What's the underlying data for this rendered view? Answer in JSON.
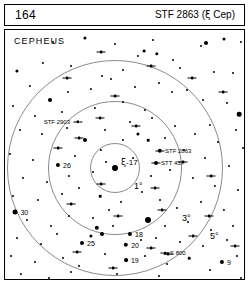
{
  "header": {
    "page_number": "164",
    "title_prefix": "STF 2863 (",
    "title_greek": "ξ",
    "title_suffix": " Cep)"
  },
  "chart_data": {
    "type": "scatter",
    "title": "STF 2863 (ξ Cep)",
    "subtitle": "CEPHEUS",
    "constellation": "CEPHEUS",
    "xlabel": "",
    "ylabel": "",
    "grid": false,
    "legend_position": "none",
    "projection": "finder chart, north up",
    "center_object": "ξ-17",
    "radius_circles": [
      {
        "label": "1°",
        "radius_deg": 1,
        "px_radius": 25,
        "label_x": 126,
        "label_y": 156
      },
      {
        "label": "3°",
        "radius_deg": 3,
        "px_radius": 67,
        "label_x": 174,
        "label_y": 188
      },
      {
        "label": "5°",
        "radius_deg": 5,
        "px_radius": 108,
        "label_x": 202,
        "label_y": 206
      }
    ],
    "center_px": {
      "x": 110,
      "y": 138
    },
    "named_objects": [
      {
        "name": "STF 2903",
        "type": "double",
        "x": 73,
        "y": 92,
        "label_side": "left",
        "mag_px": 3.4
      },
      {
        "name": "STF 2863",
        "type": "double",
        "x": 155,
        "y": 121,
        "label_side": "right",
        "mag_px": 4.4
      },
      {
        "name": "STT 457",
        "type": "double",
        "x": 151,
        "y": 133,
        "label_side": "right",
        "mag_px": 4.0
      },
      {
        "name": "S 800",
        "type": "double",
        "x": 160,
        "y": 223,
        "label_side": "right",
        "mag_px": 2.6
      },
      {
        "name": "ξ-17",
        "type": "center",
        "x": 110,
        "y": 158,
        "label_side": "right",
        "mag_px": 6.0
      }
    ],
    "labeled_stars": [
      {
        "label": "7",
        "x": 234,
        "y": 84,
        "mag_px": 4.6,
        "label_side": "right"
      },
      {
        "label": "26",
        "x": 53,
        "y": 135,
        "mag_px": 4.2,
        "label_side": "right"
      },
      {
        "label": "30",
        "x": 10,
        "y": 182,
        "mag_px": 4.8,
        "label_side": "right"
      },
      {
        "label": "25",
        "x": 77,
        "y": 213,
        "mag_px": 4.0,
        "label_side": "right"
      },
      {
        "label": "18",
        "x": 125,
        "y": 204,
        "mag_px": 4.2,
        "label_side": "right"
      },
      {
        "label": "20",
        "x": 121,
        "y": 215,
        "mag_px": 4.4,
        "label_side": "right"
      },
      {
        "label": "19",
        "x": 121,
        "y": 230,
        "mag_px": 3.8,
        "label_side": "right"
      },
      {
        "label": "9",
        "x": 217,
        "y": 232,
        "mag_px": 4.2,
        "label_side": "right"
      },
      {
        "label": "V-10",
        "x": 195,
        "y": 261,
        "mag_px": 5.0,
        "label_side": "right"
      },
      {
        "label": "12",
        "x": 186,
        "y": 278,
        "mag_px": 3.2,
        "label_side": "right"
      }
    ],
    "field_stars": [
      {
        "x": 80,
        "y": 8,
        "r": 1.6
      },
      {
        "x": 110,
        "y": 14,
        "r": 1.0
      },
      {
        "x": 148,
        "y": 10,
        "r": 1.1
      },
      {
        "x": 152,
        "y": 24,
        "r": 1.7
      },
      {
        "x": 196,
        "y": 16,
        "r": 1.0
      },
      {
        "x": 201,
        "y": 13,
        "r": 2.0
      },
      {
        "x": 219,
        "y": 9,
        "r": 1.5
      },
      {
        "x": 236,
        "y": 12,
        "r": 1.1
      },
      {
        "x": 48,
        "y": 12,
        "r": 1.0
      },
      {
        "x": 133,
        "y": 26,
        "r": 1.1
      },
      {
        "x": 139,
        "y": 21,
        "r": 1.4
      },
      {
        "x": 168,
        "y": 30,
        "r": 1.0
      },
      {
        "x": 175,
        "y": 38,
        "r": 1.0
      },
      {
        "x": 12,
        "y": 41,
        "r": 1.6
      },
      {
        "x": 38,
        "y": 33,
        "r": 1.1
      },
      {
        "x": 66,
        "y": 36,
        "r": 1.0
      },
      {
        "x": 97,
        "y": 46,
        "r": 1.0
      },
      {
        "x": 118,
        "y": 40,
        "r": 1.0
      },
      {
        "x": 209,
        "y": 42,
        "r": 1.1
      },
      {
        "x": 228,
        "y": 43,
        "r": 1.0
      },
      {
        "x": 243,
        "y": 50,
        "r": 1.0
      },
      {
        "x": 25,
        "y": 56,
        "r": 1.1
      },
      {
        "x": 45,
        "y": 70,
        "r": 2.0
      },
      {
        "x": 63,
        "y": 62,
        "r": 1.1
      },
      {
        "x": 86,
        "y": 59,
        "r": 1.1
      },
      {
        "x": 106,
        "y": 49,
        "r": 1.0
      },
      {
        "x": 130,
        "y": 57,
        "r": 1.0
      },
      {
        "x": 154,
        "y": 53,
        "r": 1.0
      },
      {
        "x": 182,
        "y": 60,
        "r": 1.0
      },
      {
        "x": 198,
        "y": 70,
        "r": 1.0
      },
      {
        "x": 222,
        "y": 73,
        "r": 1.0
      },
      {
        "x": 244,
        "y": 82,
        "r": 1.4
      },
      {
        "x": 8,
        "y": 76,
        "r": 1.0
      },
      {
        "x": 30,
        "y": 86,
        "r": 1.0
      },
      {
        "x": 57,
        "y": 82,
        "r": 1.0
      },
      {
        "x": 90,
        "y": 78,
        "r": 1.1
      },
      {
        "x": 118,
        "y": 72,
        "r": 1.0
      },
      {
        "x": 140,
        "y": 80,
        "r": 1.0
      },
      {
        "x": 167,
        "y": 62,
        "r": 1.0
      },
      {
        "x": 205,
        "y": 95,
        "r": 1.1
      },
      {
        "x": 231,
        "y": 100,
        "r": 1.0
      },
      {
        "x": 15,
        "y": 100,
        "r": 1.0
      },
      {
        "x": 37,
        "y": 104,
        "r": 1.1
      },
      {
        "x": 62,
        "y": 98,
        "r": 1.0
      },
      {
        "x": 80,
        "y": 110,
        "r": 2.0
      },
      {
        "x": 100,
        "y": 100,
        "r": 1.0
      },
      {
        "x": 125,
        "y": 92,
        "r": 1.0
      },
      {
        "x": 147,
        "y": 88,
        "r": 1.0
      },
      {
        "x": 170,
        "y": 96,
        "r": 1.0
      },
      {
        "x": 190,
        "y": 104,
        "r": 1.0
      },
      {
        "x": 213,
        "y": 112,
        "r": 1.0
      },
      {
        "x": 238,
        "y": 118,
        "r": 1.0
      },
      {
        "x": 5,
        "y": 124,
        "r": 1.0
      },
      {
        "x": 28,
        "y": 130,
        "r": 1.0
      },
      {
        "x": 70,
        "y": 126,
        "r": 1.0
      },
      {
        "x": 96,
        "y": 120,
        "r": 1.1
      },
      {
        "x": 118,
        "y": 110,
        "r": 1.1
      },
      {
        "x": 133,
        "y": 104,
        "r": 1.6
      },
      {
        "x": 143,
        "y": 110,
        "r": 1.3
      },
      {
        "x": 160,
        "y": 108,
        "r": 1.0
      },
      {
        "x": 179,
        "y": 120,
        "r": 1.0
      },
      {
        "x": 200,
        "y": 128,
        "r": 1.0
      },
      {
        "x": 224,
        "y": 136,
        "r": 1.0
      },
      {
        "x": 244,
        "y": 140,
        "r": 1.0
      },
      {
        "x": 18,
        "y": 148,
        "r": 1.0
      },
      {
        "x": 42,
        "y": 152,
        "r": 1.0
      },
      {
        "x": 64,
        "y": 146,
        "r": 1.1
      },
      {
        "x": 88,
        "y": 142,
        "r": 1.0
      },
      {
        "x": 101,
        "y": 132,
        "r": 1.0
      },
      {
        "x": 128,
        "y": 128,
        "r": 1.0
      },
      {
        "x": 146,
        "y": 146,
        "r": 1.0
      },
      {
        "x": 165,
        "y": 140,
        "r": 1.0
      },
      {
        "x": 188,
        "y": 148,
        "r": 1.1
      },
      {
        "x": 210,
        "y": 156,
        "r": 1.1
      },
      {
        "x": 233,
        "y": 160,
        "r": 1.0
      },
      {
        "x": 8,
        "y": 166,
        "r": 1.0
      },
      {
        "x": 33,
        "y": 170,
        "r": 1.0
      },
      {
        "x": 57,
        "y": 164,
        "r": 1.0
      },
      {
        "x": 74,
        "y": 158,
        "r": 1.0
      },
      {
        "x": 95,
        "y": 166,
        "r": 1.3
      },
      {
        "x": 116,
        "y": 172,
        "r": 1.0
      },
      {
        "x": 137,
        "y": 162,
        "r": 1.0
      },
      {
        "x": 155,
        "y": 170,
        "r": 1.0
      },
      {
        "x": 172,
        "y": 178,
        "r": 1.0
      },
      {
        "x": 196,
        "y": 172,
        "r": 1.0
      },
      {
        "x": 219,
        "y": 180,
        "r": 1.1
      },
      {
        "x": 241,
        "y": 176,
        "r": 1.0
      },
      {
        "x": 22,
        "y": 190,
        "r": 1.0
      },
      {
        "x": 46,
        "y": 196,
        "r": 1.0
      },
      {
        "x": 64,
        "y": 186,
        "r": 1.1
      },
      {
        "x": 88,
        "y": 188,
        "r": 1.0
      },
      {
        "x": 104,
        "y": 180,
        "r": 1.0
      },
      {
        "x": 143,
        "y": 190,
        "r": 3.0
      },
      {
        "x": 160,
        "y": 196,
        "r": 1.0
      },
      {
        "x": 183,
        "y": 192,
        "r": 1.0
      },
      {
        "x": 206,
        "y": 200,
        "r": 1.0
      },
      {
        "x": 228,
        "y": 196,
        "r": 1.0
      },
      {
        "x": 12,
        "y": 208,
        "r": 1.0
      },
      {
        "x": 36,
        "y": 214,
        "r": 1.0
      },
      {
        "x": 52,
        "y": 204,
        "r": 1.0
      },
      {
        "x": 92,
        "y": 198,
        "r": 2.2
      },
      {
        "x": 97,
        "y": 204,
        "r": 2.0
      },
      {
        "x": 86,
        "y": 206,
        "r": 1.6
      },
      {
        "x": 108,
        "y": 196,
        "r": 1.0
      },
      {
        "x": 136,
        "y": 210,
        "r": 1.0
      },
      {
        "x": 151,
        "y": 208,
        "r": 1.0
      },
      {
        "x": 175,
        "y": 212,
        "r": 1.0
      },
      {
        "x": 198,
        "y": 216,
        "r": 1.0
      },
      {
        "x": 222,
        "y": 210,
        "r": 1.0
      },
      {
        "x": 242,
        "y": 206,
        "r": 1.0
      },
      {
        "x": 6,
        "y": 226,
        "r": 1.0
      },
      {
        "x": 30,
        "y": 232,
        "r": 1.0
      },
      {
        "x": 58,
        "y": 228,
        "r": 1.0
      },
      {
        "x": 74,
        "y": 236,
        "r": 1.0
      },
      {
        "x": 100,
        "y": 224,
        "r": 1.0
      },
      {
        "x": 140,
        "y": 226,
        "r": 1.1
      },
      {
        "x": 162,
        "y": 234,
        "r": 1.0
      },
      {
        "x": 184,
        "y": 228,
        "r": 1.3
      },
      {
        "x": 205,
        "y": 240,
        "r": 1.0
      },
      {
        "x": 232,
        "y": 226,
        "r": 1.0
      },
      {
        "x": 16,
        "y": 244,
        "r": 1.1
      },
      {
        "x": 44,
        "y": 248,
        "r": 1.0
      },
      {
        "x": 66,
        "y": 242,
        "r": 1.0
      },
      {
        "x": 88,
        "y": 250,
        "r": 1.0
      },
      {
        "x": 112,
        "y": 244,
        "r": 1.0
      },
      {
        "x": 130,
        "y": 252,
        "r": 1.0
      },
      {
        "x": 154,
        "y": 246,
        "r": 1.0
      },
      {
        "x": 172,
        "y": 254,
        "r": 1.6
      },
      {
        "x": 210,
        "y": 252,
        "r": 1.0
      },
      {
        "x": 236,
        "y": 248,
        "r": 1.0
      },
      {
        "x": 52,
        "y": 262,
        "r": 1.0
      },
      {
        "x": 78,
        "y": 268,
        "r": 1.0
      },
      {
        "x": 104,
        "y": 262,
        "r": 1.0
      },
      {
        "x": 122,
        "y": 270,
        "r": 2.6
      },
      {
        "x": 140,
        "y": 264,
        "r": 1.0
      },
      {
        "x": 160,
        "y": 272,
        "r": 1.0
      },
      {
        "x": 228,
        "y": 266,
        "r": 1.0
      },
      {
        "x": 24,
        "y": 272,
        "r": 1.0
      }
    ],
    "doubles": [
      {
        "x": 96,
        "y": 22
      },
      {
        "x": 146,
        "y": 36
      },
      {
        "x": 62,
        "y": 48
      },
      {
        "x": 110,
        "y": 66
      },
      {
        "x": 187,
        "y": 48
      },
      {
        "x": 53,
        "y": 118
      },
      {
        "x": 74,
        "y": 108
      },
      {
        "x": 131,
        "y": 96
      },
      {
        "x": 178,
        "y": 132
      },
      {
        "x": 206,
        "y": 146
      },
      {
        "x": 150,
        "y": 158
      },
      {
        "x": 96,
        "y": 154
      },
      {
        "x": 66,
        "y": 174
      },
      {
        "x": 113,
        "y": 186
      },
      {
        "x": 157,
        "y": 180
      },
      {
        "x": 188,
        "y": 206
      },
      {
        "x": 146,
        "y": 218
      },
      {
        "x": 108,
        "y": 238
      },
      {
        "x": 72,
        "y": 222
      },
      {
        "x": 204,
        "y": 186
      },
      {
        "x": 230,
        "y": 216
      },
      {
        "x": 178,
        "y": 268
      },
      {
        "x": 126,
        "y": 258
      },
      {
        "x": 34,
        "y": 252
      },
      {
        "x": 218,
        "y": 62
      },
      {
        "x": 95,
        "y": 88
      },
      {
        "x": 163,
        "y": 224
      },
      {
        "x": 199,
        "y": 270
      }
    ]
  },
  "caption": ""
}
